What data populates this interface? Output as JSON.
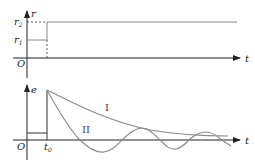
{
  "top_graph": {
    "y_axis_label": "r",
    "x_axis_label": "t",
    "origin_label": "O",
    "level_high_label": "r",
    "level_high_sub": "2",
    "level_low_label": "r",
    "level_low_sub": "1"
  },
  "bottom_graph": {
    "y_axis_label": "e",
    "x_axis_label": "t",
    "origin_label": "O",
    "step_time_label": "t",
    "step_time_sub": "0",
    "curves": [
      {
        "label": "I",
        "description": "monotonic exponential decay"
      },
      {
        "label": "II",
        "description": "damped oscillation"
      }
    ]
  },
  "colors": {
    "axis": "#222222",
    "curve": "#8a8a8a",
    "signal": "#888888"
  }
}
